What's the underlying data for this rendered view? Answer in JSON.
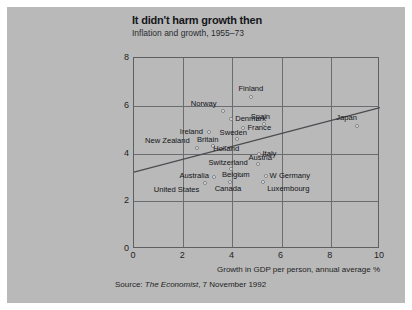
{
  "header": {
    "title": "It didn't harm growth then",
    "subtitle": "Inflation and growth, 1955–73"
  },
  "source": {
    "prefix": "Source: ",
    "publication": "The Economist",
    "suffix": ", 7 November 1992",
    "full": "Source: The Economist, 7 November 1992"
  },
  "chart_data": {
    "type": "scatter",
    "title": "It didn't harm growth then",
    "subtitle": "Inflation and growth, 1955–73",
    "xlabel": "Growth in GDP per person, annual average %",
    "ylabel": "Inflation %, annual average",
    "xlim": [
      0,
      10
    ],
    "ylim": [
      0,
      8
    ],
    "xticks": [
      0,
      2,
      4,
      6,
      8,
      10
    ],
    "yticks": [
      0,
      2,
      4,
      6,
      8
    ],
    "grid": true,
    "legend": "none",
    "points": [
      {
        "name": "Japan",
        "x": 9.05,
        "y": 5.15,
        "label_dx": -10,
        "label_dy": -12,
        "align": "c"
      },
      {
        "name": "Finland",
        "x": 4.75,
        "y": 6.35,
        "label_dx": 0,
        "label_dy": -12,
        "align": "c"
      },
      {
        "name": "Norway",
        "x": 3.6,
        "y": 5.8,
        "label_dx": -6,
        "label_dy": -11,
        "align": "r"
      },
      {
        "name": "Denmark",
        "x": 3.95,
        "y": 5.45,
        "label_dx": 4,
        "label_dy": -4,
        "align": "l"
      },
      {
        "name": "Spain",
        "x": 5.3,
        "y": 5.25,
        "label_dx": -4,
        "label_dy": -11,
        "align": "c"
      },
      {
        "name": "France",
        "x": 4.45,
        "y": 5.05,
        "label_dx": 4,
        "label_dy": -4,
        "align": "l"
      },
      {
        "name": "Ireland",
        "x": 3.05,
        "y": 4.9,
        "label_dx": -6,
        "label_dy": -4,
        "align": "r"
      },
      {
        "name": "Sweden",
        "x": 4.2,
        "y": 4.6,
        "label_dx": -4,
        "label_dy": -10,
        "align": "c"
      },
      {
        "name": "Britain",
        "x": 3.2,
        "y": 4.3,
        "label_dx": -5,
        "label_dy": -10,
        "align": "c"
      },
      {
        "name": "Holland",
        "x": 3.75,
        "y": 4.25,
        "label_dx": 0,
        "label_dy": -3,
        "align": "c"
      },
      {
        "name": "New Zealand",
        "x": 2.55,
        "y": 4.25,
        "label_dx": -7,
        "label_dy": -11,
        "align": "r"
      },
      {
        "name": "Italy",
        "x": 5.1,
        "y": 4.0,
        "label_dx": 3,
        "label_dy": -4,
        "align": "l"
      },
      {
        "name": "Austria",
        "x": 5.05,
        "y": 3.55,
        "label_dx": 2,
        "label_dy": -10,
        "align": "c"
      },
      {
        "name": "Switzerland",
        "x": 3.95,
        "y": 3.35,
        "label_dx": -3,
        "label_dy": -10,
        "align": "c"
      },
      {
        "name": "Belgium",
        "x": 4.3,
        "y": 3.1,
        "label_dx": -4,
        "label_dy": -4,
        "align": "c"
      },
      {
        "name": "Australia",
        "x": 3.25,
        "y": 3.0,
        "label_dx": -5,
        "label_dy": -5,
        "align": "r"
      },
      {
        "name": "W Germany",
        "x": 5.35,
        "y": 3.05,
        "label_dx": 4,
        "label_dy": -4,
        "align": "l"
      },
      {
        "name": "Luxembourg",
        "x": 5.25,
        "y": 2.8,
        "label_dx": 4,
        "label_dy": 3,
        "align": "l"
      },
      {
        "name": "Canada",
        "x": 3.9,
        "y": 2.8,
        "label_dx": -2,
        "label_dy": 3,
        "align": "c"
      },
      {
        "name": "United States",
        "x": 2.9,
        "y": 2.75,
        "label_dx": -6,
        "label_dy": 3,
        "align": "r"
      }
    ],
    "trendline": {
      "label": "regression-line",
      "x0": 0.0,
      "y0": 3.22,
      "x1": 10.0,
      "y1": 5.92
    }
  },
  "colors": {
    "panel_background": "#b9b9b9",
    "page_background": "#ffffff",
    "axis": "#5d5f63",
    "grid": "#6a6c70",
    "text": "#15161a",
    "marker_fill": "#efefef",
    "marker_edge": "#7d7f83",
    "trendline": "#4a4c50"
  }
}
